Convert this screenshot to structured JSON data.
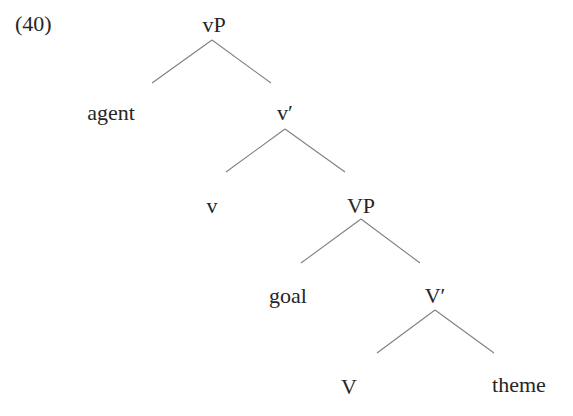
{
  "example_number": "(40)",
  "tree": {
    "nodes": [
      {
        "id": "vP",
        "label": "vP",
        "x": 214,
        "y": 14
      },
      {
        "id": "agent",
        "label": "agent",
        "x": 111,
        "y": 102
      },
      {
        "id": "v_bar",
        "label": "v′",
        "x": 285,
        "y": 102
      },
      {
        "id": "v",
        "label": "v",
        "x": 212,
        "y": 195
      },
      {
        "id": "VP",
        "label": "VP",
        "x": 361,
        "y": 195
      },
      {
        "id": "goal",
        "label": "goal",
        "x": 288,
        "y": 285
      },
      {
        "id": "V_bar",
        "label": "V′",
        "x": 435,
        "y": 285
      },
      {
        "id": "V",
        "label": "V",
        "x": 349,
        "y": 376
      },
      {
        "id": "theme",
        "label": "theme",
        "x": 519,
        "y": 374
      }
    ],
    "edges": [
      {
        "from": "vP",
        "to": "agent",
        "x1": 212,
        "y1": 40,
        "x2": 152,
        "y2": 83
      },
      {
        "from": "vP",
        "to": "v_bar",
        "x1": 212,
        "y1": 40,
        "x2": 271,
        "y2": 83
      },
      {
        "from": "v_bar",
        "to": "v",
        "x1": 285,
        "y1": 129,
        "x2": 226,
        "y2": 172
      },
      {
        "from": "v_bar",
        "to": "VP",
        "x1": 285,
        "y1": 129,
        "x2": 345,
        "y2": 172
      },
      {
        "from": "VP",
        "to": "goal",
        "x1": 361,
        "y1": 219,
        "x2": 301,
        "y2": 263
      },
      {
        "from": "VP",
        "to": "V_bar",
        "x1": 361,
        "y1": 219,
        "x2": 420,
        "y2": 263
      },
      {
        "from": "V_bar",
        "to": "V",
        "x1": 435,
        "y1": 310,
        "x2": 377,
        "y2": 353
      },
      {
        "from": "V_bar",
        "to": "theme",
        "x1": 435,
        "y1": 310,
        "x2": 494,
        "y2": 353
      }
    ]
  }
}
